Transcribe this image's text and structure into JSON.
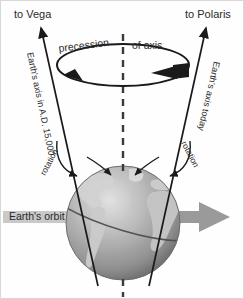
{
  "figure": {
    "background_color": "#fefefe",
    "border_color": "#d8d8d8"
  },
  "labels": {
    "to_vega": "to Vega",
    "to_polaris": "to Polaris",
    "precession_left": "precession",
    "precession_right": "of axis",
    "axis_future": "Earth's axis in A.D. 15,000",
    "axis_today": "Earth's axis today",
    "rotation_left": "rotation",
    "rotation_right": "rotation",
    "earths_orbit": "Earth's orbit"
  },
  "colors": {
    "ink": "#2b2b2b",
    "line": "#1a1a1a",
    "dashed_axis": "#3a3a3a",
    "orbit_arrow": "#8c8c8c",
    "orbit_band": "#c9c9c9",
    "globe_ocean_light": "#d6d6d6",
    "globe_ocean_mid": "#a5a5a5",
    "globe_ocean_dark": "#6e6e6e",
    "globe_land": "#cfcfcf",
    "globe_outline": "#4a4a4a"
  },
  "geometry": {
    "vega_arrow_tip": "38,22",
    "polaris_arrow_tip": "207,22",
    "globe_center": "122,222",
    "globe_radius": "57",
    "vertical_dashed_axis_x": "122"
  }
}
